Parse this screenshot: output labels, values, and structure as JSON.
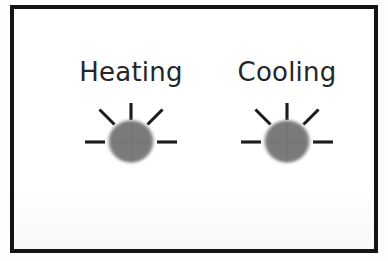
{
  "panel": {
    "background_color": "#fdfdfd",
    "frame_color": "#141414",
    "frame_border_width": 4
  },
  "indicators": [
    {
      "id": "heating",
      "label": "Heating",
      "icon": "lamp-indicator-icon",
      "lamp_fill_color": "#7a7a7a",
      "ray_color": "#1a1a1a",
      "ray_count": 5
    },
    {
      "id": "cooling",
      "label": "Cooling",
      "icon": "lamp-indicator-icon",
      "lamp_fill_color": "#7a7a7a",
      "ray_color": "#1a1a1a",
      "ray_count": 5
    }
  ]
}
